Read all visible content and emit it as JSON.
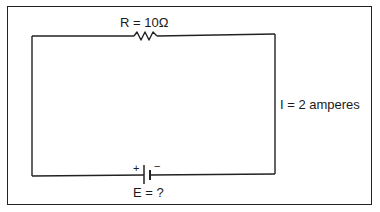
{
  "diagram": {
    "type": "series circuit",
    "resistor": {
      "label": "R = 10Ω",
      "resistance_ohms": 10
    },
    "current": {
      "label": "I = 2 amperes",
      "amperes": 2
    },
    "battery": {
      "label": "E = ?",
      "plus": "+",
      "minus": "−",
      "voltage": "unknown"
    },
    "colors": {
      "line": "#222222",
      "background": "#ffffff"
    }
  }
}
